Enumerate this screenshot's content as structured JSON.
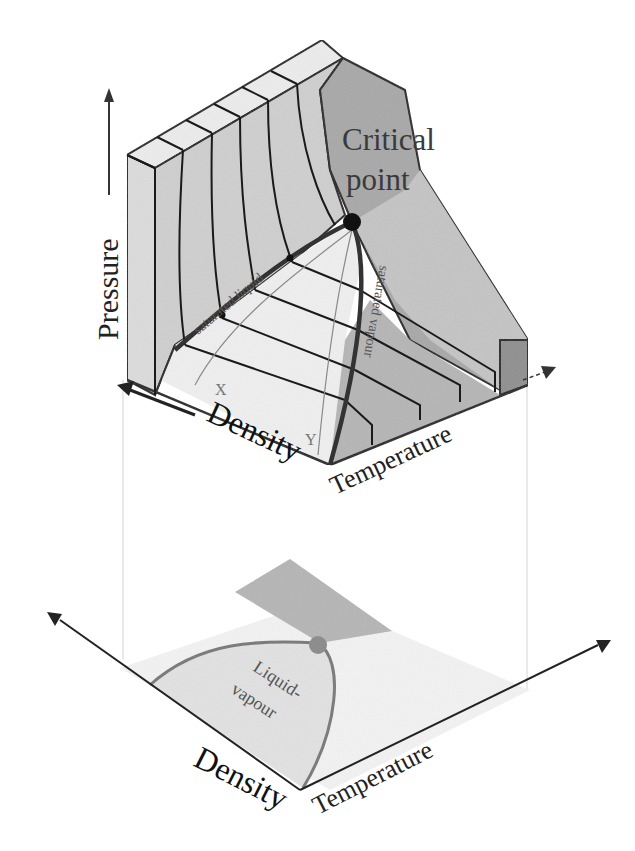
{
  "top_diagram": {
    "title": "P-rho-T surface",
    "axes": {
      "pressure": "Pressure",
      "density": "Density",
      "temperature": "Temperature"
    },
    "annotations": {
      "critical_point_line1": "Critical",
      "critical_point_line2": "point",
      "saturated_liquid": "saturated liquid",
      "saturated_vapour": "saturated vapour",
      "point_x": "X",
      "point_y": "Y"
    }
  },
  "bottom_diagram": {
    "title": "Projection onto density-temperature plane",
    "axes": {
      "density": "Density",
      "temperature": "Temperature"
    },
    "region_label_line1": "Liquid-",
    "region_label_line2": "vapour"
  },
  "colors": {
    "line": "#1a1a1a",
    "light_face": "#e6e6e6",
    "mid_face": "#bdbdbd",
    "dark_face": "#9a9a9a",
    "gas_region": "#b0b0b0",
    "critical_point_top": "#111111",
    "critical_point_bottom": "#8a8a8a",
    "guide_line": "#d0d0d0"
  }
}
